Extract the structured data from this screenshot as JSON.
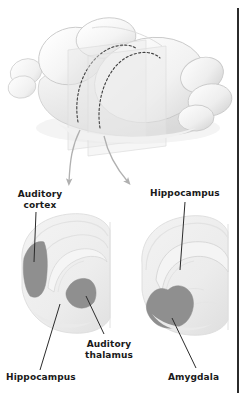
{
  "figure": {
    "background_color": "#ffffff",
    "width": 246,
    "height": 401
  },
  "colors": {
    "label_text": "#1a1a1a",
    "leader_line": "#2b2b2b",
    "highlight_region": "#8f8f8f",
    "section_tissue": "#efefef",
    "section_outline": "#dcdcdc",
    "brain_fill": "#f7f7f7",
    "brain_outline": "#cfcfcf",
    "arrow": "#b3b3b3",
    "cut_plane": "#e8e8e8",
    "dashed_outline": "#4a4a4a",
    "edge_rule": "#2b2b2b"
  },
  "brain_3d": {
    "name": "rodent-brain-3d",
    "parts": [
      "olfactory-bulb",
      "left-cortical-hemisphere",
      "right-cortical-hemisphere",
      "cerebellum",
      "brainstem"
    ],
    "cut_planes": [
      {
        "name": "anterior-section-plane",
        "dashed_outline": true
      },
      {
        "name": "posterior-section-plane",
        "dashed_outline": true
      }
    ]
  },
  "arrows": [
    {
      "name": "arrow-to-left-section",
      "from": "anterior-section-plane",
      "to": "left-coronal-section"
    },
    {
      "name": "arrow-to-right-section",
      "from": "posterior-section-plane",
      "to": "right-coronal-section"
    }
  ],
  "sections": [
    {
      "name": "left-coronal-section",
      "position": "anterior",
      "highlighted_regions": [
        {
          "name": "auditory-cortex",
          "label": "Auditory\ncortex",
          "shade": "#8f8f8f"
        },
        {
          "name": "auditory-thalamus",
          "label": "Auditory\nthalamus",
          "shade": "#8f8f8f"
        }
      ],
      "outlined_regions": [
        {
          "name": "hippocampus",
          "label": "Hippocampus"
        }
      ]
    },
    {
      "name": "right-coronal-section",
      "position": "posterior",
      "highlighted_regions": [
        {
          "name": "amygdala",
          "label": "Amygdala",
          "shade": "#8f8f8f"
        }
      ],
      "outlined_regions": [
        {
          "name": "hippocampus",
          "label": "Hippocampus"
        }
      ]
    }
  ],
  "labels": {
    "auditory_cortex": "Auditory\ncortex",
    "hippocampus_right": "Hippocampus",
    "hippocampus_left": "Hippocampus",
    "auditory_thalamus": "Auditory\nthalamus",
    "amygdala": "Amygdala"
  }
}
